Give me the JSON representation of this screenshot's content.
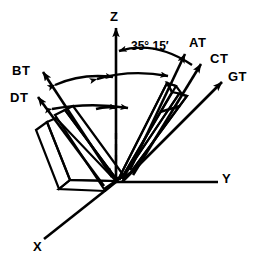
{
  "figure": {
    "background_color": "#ffffff",
    "stroke_color": "#000000",
    "width": 260,
    "height": 265
  },
  "axes": [
    {
      "id": "z",
      "label": "Z",
      "label_x": 110,
      "label_y": 10,
      "description": "vertical axis pointing up"
    },
    {
      "id": "y",
      "label": "Y",
      "label_x": 222,
      "label_y": 172,
      "description": "horizontal axis pointing right"
    },
    {
      "id": "x",
      "label": "X",
      "label_x": 33,
      "label_y": 240,
      "description": "oblique axis pointing down-left"
    }
  ],
  "vectors": [
    {
      "id": "bt",
      "label": "BT",
      "label_x": 12,
      "label_y": 64,
      "direction": "upper-left"
    },
    {
      "id": "dt",
      "label": "DT",
      "label_x": 10,
      "label_y": 91,
      "direction": "upper-left"
    },
    {
      "id": "at",
      "label": "AT",
      "label_x": 189,
      "label_y": 36,
      "direction": "upper-right"
    },
    {
      "id": "ct",
      "label": "CT",
      "label_x": 210,
      "label_y": 52,
      "direction": "upper-right"
    },
    {
      "id": "gt",
      "label": "GT",
      "label_x": 228,
      "label_y": 70,
      "direction": "upper-right"
    }
  ],
  "annotations": [
    {
      "id": "angle-35-15",
      "label": "35° 15′",
      "label_x": 131,
      "label_y": 40,
      "description": "angle between Z axis and AT vector"
    }
  ]
}
